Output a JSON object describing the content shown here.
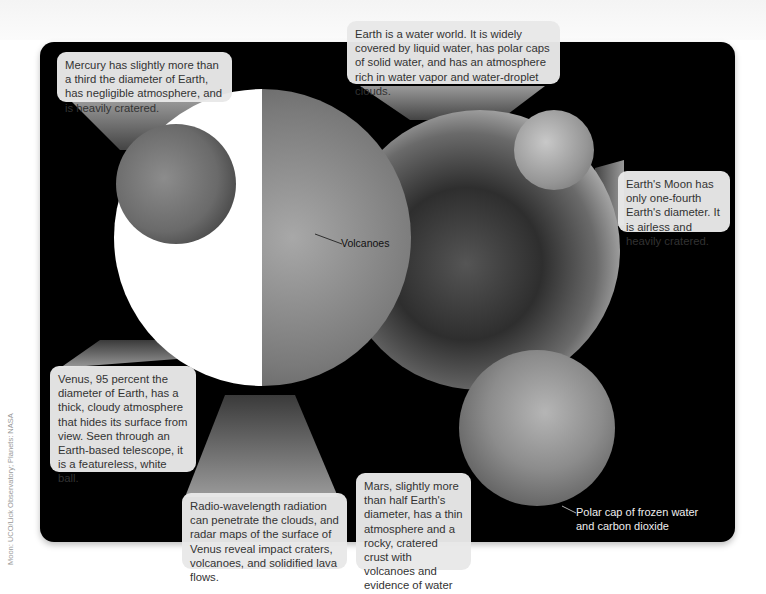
{
  "figure": {
    "callouts": {
      "mercury": "Mercury has slightly more than a third the diameter of Earth, has negligible atmosphere, and is heavily cratered.",
      "earth": "Earth is a water world. It is widely covered by liquid water, has polar caps of solid water, and has an atmosphere rich in water vapor and water-droplet clouds.",
      "moon": "Earth's Moon has only one-fourth Earth's diameter. It is airless and heavily cratered.",
      "venus": "Venus, 95 percent the diameter of Earth, has a thick, cloudy atmosphere that hides its surface from view. Seen through an Earth-based telescope, it is a featureless, white ball.",
      "radar": "Radio-wavelength radiation can penetrate the clouds, and radar maps of the surface of Venus reveal impact craters, volcanoes, and solidified lava flows.",
      "mars": "Mars, slightly more than half Earth's diameter, has a thin atmosphere and a rocky, cratered crust with volcanoes and evidence of water erosion."
    },
    "labels": {
      "volcanoes": "Volcanoes",
      "polar_cap_line1": "Polar cap of frozen water",
      "polar_cap_line2": "and carbon dioxide"
    },
    "credit": "Moon: UCO/Lick Observatory; Planets: NASA",
    "planets": [
      "Mercury",
      "Venus",
      "Earth",
      "Moon",
      "Mars"
    ]
  }
}
